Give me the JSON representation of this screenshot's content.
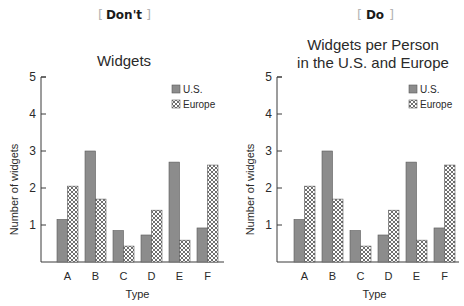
{
  "panels": [
    {
      "header": "Don't",
      "title_lines": [
        "Widgets"
      ]
    },
    {
      "header": "Do",
      "title_lines": [
        "Widgets per Person",
        "in the U.S. and Europe"
      ]
    }
  ],
  "colors": {
    "us_fill": "#8c8c8c",
    "europe_fill": "#ffffff",
    "europe_hatch": "#4a4a4a",
    "axis": "#3a3a3a",
    "bracket": "#b4b4b4"
  },
  "chart_data": [
    {
      "type": "bar",
      "title": "Widgets",
      "header": "Don't",
      "categories": [
        "A",
        "B",
        "C",
        "D",
        "E",
        "F"
      ],
      "series": [
        {
          "name": "U.S.",
          "values": [
            1.15,
            3.0,
            0.85,
            0.73,
            2.7,
            0.92
          ]
        },
        {
          "name": "Europe",
          "values": [
            2.05,
            1.7,
            0.43,
            1.4,
            0.59,
            2.62
          ]
        }
      ],
      "xlabel": "Type",
      "ylabel": "Number of widgets",
      "yticks": [
        1,
        2,
        3,
        4,
        5
      ],
      "ylim": [
        0,
        5
      ],
      "grid": false,
      "legend_position": "top-right"
    },
    {
      "type": "bar",
      "title": "Widgets per Person in the U.S. and Europe",
      "header": "Do",
      "categories": [
        "A",
        "B",
        "C",
        "D",
        "E",
        "F"
      ],
      "series": [
        {
          "name": "U.S.",
          "values": [
            1.15,
            3.0,
            0.85,
            0.73,
            2.7,
            0.92
          ]
        },
        {
          "name": "Europe",
          "values": [
            2.05,
            1.7,
            0.43,
            1.4,
            0.59,
            2.62
          ]
        }
      ],
      "xlabel": "Type",
      "ylabel": "Number of widgets",
      "yticks": [
        1,
        2,
        3,
        4,
        5
      ],
      "ylim": [
        0,
        5
      ],
      "grid": false,
      "legend_position": "top-right"
    }
  ]
}
